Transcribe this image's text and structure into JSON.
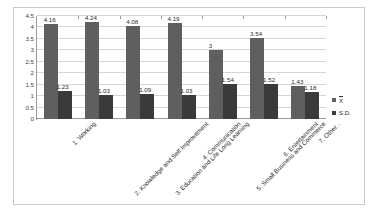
{
  "chart_data": {
    "type": "bar",
    "title": "",
    "xlabel": "",
    "ylabel": "",
    "ylim": [
      0,
      4.5
    ],
    "y_ticks": [
      "0",
      "0.5",
      "1",
      "1.5",
      "2",
      "2.5",
      "3",
      "3.5",
      "4",
      "4.5"
    ],
    "grid": true,
    "legend_position": "right",
    "categories": [
      "1. Working",
      "2. Knowledge and Self Improvement",
      "3. Education and Life Long Learning",
      "4. Communication",
      "5. Small Business and Commerce",
      "6. Entertainment",
      "7. Other..."
    ],
    "series": [
      {
        "name": "X̄",
        "color": "#5f5f5f",
        "values": [
          4.16,
          4.24,
          4.08,
          4.19,
          3,
          3.54,
          1.43
        ],
        "labels": [
          "4.16",
          "4.24",
          "4.08",
          "4.19",
          "3",
          "3.54",
          "1.43"
        ]
      },
      {
        "name": "S.D.",
        "color": "#3a3a3a",
        "values": [
          1.23,
          1.03,
          1.09,
          1.03,
          1.54,
          1.52,
          1.18
        ],
        "labels": [
          "1.23",
          "1.03",
          "1.09",
          "1.03",
          "1.54",
          "1.52",
          "1.18"
        ]
      }
    ]
  },
  "legend": {
    "entries": [
      {
        "label_base": "X",
        "label_full": "X̄"
      },
      {
        "label_base": "S.D.",
        "label_full": "S.D."
      }
    ]
  }
}
